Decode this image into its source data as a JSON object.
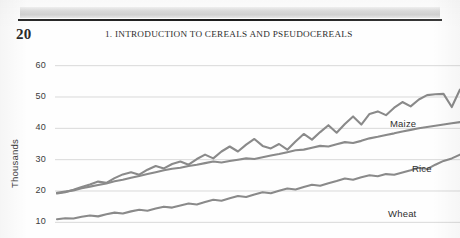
{
  "page": {
    "number": "20",
    "running_head": "1.  INTRODUCTION TO CEREALS AND PSEUDOCEREALS"
  },
  "chart_data": {
    "type": "line",
    "title": "",
    "xlabel": "",
    "ylabel": "Thousands",
    "ylim": [
      5,
      65
    ],
    "yticks": [
      60,
      50,
      40,
      30,
      20,
      10
    ],
    "ytick_labels": [
      "60",
      "50",
      "40",
      "30",
      "20",
      "10"
    ],
    "grid": true,
    "legend_position": "inline-right",
    "line_color": "#8a8a8a",
    "grid_color": "#d9d9d9",
    "x": [
      0,
      1,
      2,
      3,
      4,
      5,
      6,
      7,
      8,
      9,
      10,
      11,
      12,
      13,
      14,
      15,
      16,
      17,
      18,
      19,
      20,
      21,
      22,
      23,
      24,
      25,
      26,
      27,
      28,
      29,
      30,
      31,
      32,
      33,
      34,
      35,
      36,
      37,
      38,
      39,
      40,
      41,
      42,
      43,
      44,
      45,
      46,
      47,
      48,
      49
    ],
    "series": [
      {
        "name": "Maize",
        "label": "Maize",
        "values": [
          19.2,
          19.6,
          20.4,
          21.3,
          22.1,
          23.0,
          22.6,
          24.1,
          25.3,
          26.0,
          25.2,
          26.8,
          28.0,
          27.2,
          28.6,
          29.4,
          28.4,
          30.2,
          31.6,
          30.4,
          32.6,
          34.2,
          32.6,
          34.8,
          36.6,
          34.4,
          33.6,
          35.0,
          33.2,
          35.8,
          38.2,
          36.4,
          38.8,
          41.0,
          38.6,
          41.4,
          43.8,
          41.2,
          44.6,
          45.4,
          44.2,
          46.6,
          48.4,
          47.0,
          49.2,
          50.6,
          50.9,
          51.0,
          46.8,
          52.4
        ]
      },
      {
        "name": "Rice",
        "label": "Rice",
        "values": [
          19.4,
          19.8,
          20.2,
          20.9,
          21.4,
          21.9,
          22.4,
          23.1,
          23.6,
          24.2,
          24.8,
          25.4,
          26.0,
          26.6,
          27.1,
          27.4,
          28.0,
          28.4,
          28.9,
          29.4,
          29.1,
          29.6,
          30.0,
          30.4,
          30.2,
          30.8,
          31.3,
          31.8,
          32.4,
          33.0,
          33.2,
          33.8,
          34.4,
          34.2,
          34.9,
          35.6,
          35.3,
          36.0,
          36.8,
          37.3,
          37.9,
          38.4,
          39.0,
          39.5,
          40.0,
          40.4,
          40.8,
          41.2,
          41.6,
          42.0
        ]
      },
      {
        "name": "Wheat",
        "label": "Wheat",
        "values": [
          11.0,
          11.3,
          11.2,
          11.8,
          12.2,
          11.9,
          12.6,
          13.1,
          12.8,
          13.5,
          14.0,
          13.7,
          14.4,
          15.0,
          14.7,
          15.4,
          16.0,
          15.7,
          16.5,
          17.2,
          16.9,
          17.7,
          18.4,
          18.1,
          18.9,
          19.6,
          19.3,
          20.1,
          20.8,
          20.5,
          21.3,
          22.0,
          21.7,
          22.5,
          23.2,
          24.0,
          23.6,
          24.4,
          25.0,
          24.7,
          25.4,
          25.2,
          25.9,
          26.6,
          27.4,
          27.0,
          28.4,
          29.6,
          30.4,
          31.6
        ]
      }
    ]
  }
}
